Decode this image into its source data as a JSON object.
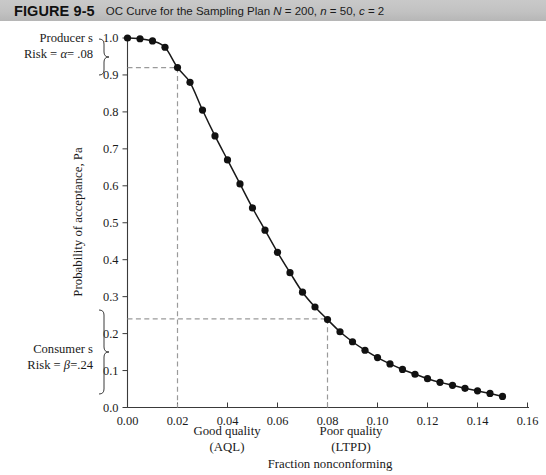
{
  "header": {
    "figure_number": "FIGURE 9-5",
    "title_prefix": "OC Curve for the Sampling Plan ",
    "title_N": "N",
    "title_N_val": " = 200, ",
    "title_n": "n",
    "title_n_val": " = 50, ",
    "title_c": "c",
    "title_c_val": " = 2",
    "title_full": "OC Curve for the Sampling Plan N = 200, n = 50, c = 2",
    "band_color": "#c2c2c2"
  },
  "annotations": {
    "producer_line1": "Producer s",
    "producer_line2_pre": "Risk = ",
    "producer_alpha": "α",
    "producer_line2_post": "= .08",
    "consumer_line1": "Consumer s",
    "consumer_line2_pre": "Risk = ",
    "consumer_beta": "β",
    "consumer_line2_post": "=.24",
    "good_quality_l1": "Good quality",
    "good_quality_l2": "(AQL)",
    "poor_quality_l1": "Poor quality",
    "poor_quality_l2": "(LTPD)"
  },
  "chart_data": {
    "type": "line",
    "title": "OC Curve for the Sampling Plan N = 200, n = 50, c = 2",
    "xlabel": "Fraction nonconforming",
    "ylabel": "Probability of acceptance, Pa",
    "xlim": [
      0.0,
      0.16
    ],
    "ylim": [
      0.0,
      1.0
    ],
    "grid": false,
    "legend": "none",
    "xticks": [
      0.0,
      0.02,
      0.04,
      0.06,
      0.08,
      0.1,
      0.12,
      0.14,
      0.16
    ],
    "xtick_labels": [
      "0.00",
      "0.02",
      "0.04",
      "0.06",
      "0.08",
      "0.10",
      "0.12",
      "0.14",
      "0.16"
    ],
    "yticks": [
      0.0,
      0.1,
      0.2,
      0.3,
      0.4,
      0.5,
      0.6,
      0.7,
      0.8,
      0.9,
      1.0
    ],
    "ytick_labels": [
      "0.0",
      "0.1",
      "0.2",
      "0.3",
      "0.4",
      "0.5",
      "0.6",
      "0.7",
      "0.8",
      "0.9",
      "1.0"
    ],
    "x": [
      0.0,
      0.005,
      0.01,
      0.015,
      0.02,
      0.025,
      0.03,
      0.035,
      0.04,
      0.045,
      0.05,
      0.055,
      0.06,
      0.065,
      0.07,
      0.075,
      0.08,
      0.085,
      0.09,
      0.095,
      0.1,
      0.105,
      0.11,
      0.115,
      0.12,
      0.125,
      0.13,
      0.135,
      0.14,
      0.145,
      0.15
    ],
    "y": [
      1.0,
      0.998,
      0.992,
      0.975,
      0.92,
      0.88,
      0.805,
      0.735,
      0.67,
      0.605,
      0.54,
      0.48,
      0.42,
      0.365,
      0.312,
      0.272,
      0.238,
      0.205,
      0.178,
      0.155,
      0.135,
      0.118,
      0.103,
      0.09,
      0.078,
      0.068,
      0.06,
      0.052,
      0.045,
      0.038,
      0.03
    ],
    "markers": "filled-circle",
    "marker_color": "#111111",
    "line_color": "#181818",
    "annotations": [
      {
        "name": "producers-risk",
        "label": "Producer's Risk = α = .08",
        "y_value": 0.92,
        "x_value": 0.02,
        "dash": true
      },
      {
        "name": "consumers-risk",
        "label": "Consumer's Risk = β = .24",
        "y_value": 0.24,
        "x_value": 0.08,
        "dash": true
      },
      {
        "name": "aql-marker",
        "label": "Good quality (AQL)",
        "x_value": 0.02
      },
      {
        "name": "ltpd-marker",
        "label": "Poor quality (LTPD)",
        "x_value": 0.08
      }
    ]
  },
  "axis": {
    "y_title": "Probability of acceptance, Pa",
    "x_title": "Fraction nonconforming"
  }
}
